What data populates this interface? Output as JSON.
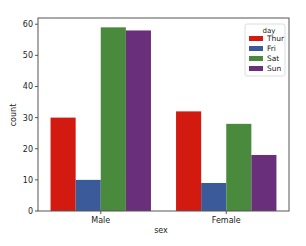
{
  "chart_data": {
    "type": "bar",
    "title": "",
    "xlabel": "sex",
    "ylabel": "count",
    "categories": [
      "Male",
      "Female"
    ],
    "series": [
      {
        "name": "Thur",
        "color": "#d21a10",
        "values": [
          30,
          32
        ]
      },
      {
        "name": "Fri",
        "color": "#3a5a9a",
        "values": [
          10,
          9
        ]
      },
      {
        "name": "Sat",
        "color": "#4a8a3c",
        "values": [
          59,
          28
        ]
      },
      {
        "name": "Sun",
        "color": "#6a2f7a",
        "values": [
          58,
          18
        ]
      }
    ],
    "yticks": [
      0,
      10,
      20,
      30,
      40,
      50,
      60
    ],
    "ylim": [
      0,
      62
    ],
    "grid": false,
    "legend": {
      "title": "day",
      "position": "upper right",
      "entries": [
        "Thur",
        "Fri",
        "Sat",
        "Sun"
      ]
    }
  }
}
